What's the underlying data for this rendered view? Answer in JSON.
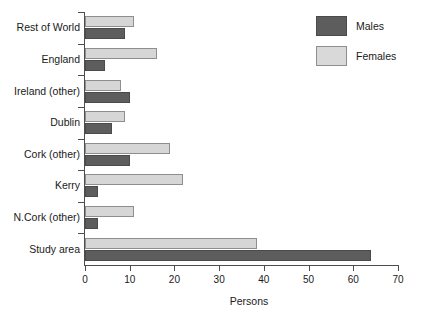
{
  "chart_data": {
    "type": "bar",
    "orientation": "horizontal",
    "title": "",
    "xlabel": "Persons",
    "ylabel": "",
    "xlim": [
      0,
      70
    ],
    "xticks": [
      0,
      10,
      20,
      30,
      40,
      50,
      60,
      70
    ],
    "grid": false,
    "legend_position": "top-right",
    "categories": [
      "Rest of World",
      "England",
      "Ireland (other)",
      "Dublin",
      "Cork (other)",
      "Kerry",
      "N.Cork (other)",
      "Study area"
    ],
    "series": [
      {
        "name": "Males",
        "color": "#5d5d5d",
        "values": [
          9,
          4.5,
          10,
          6,
          10,
          3,
          3,
          64
        ]
      },
      {
        "name": "Females",
        "color": "#d6d6d6",
        "values": [
          11,
          16,
          8,
          9,
          19,
          22,
          11,
          38.5
        ]
      }
    ]
  },
  "legend": {
    "items": [
      {
        "label": "Males",
        "swatch": "males"
      },
      {
        "label": "Females",
        "swatch": "females"
      }
    ]
  },
  "axis": {
    "x_title": "Persons",
    "x_tick_labels": [
      "0",
      "10",
      "20",
      "30",
      "40",
      "50",
      "60",
      "70"
    ]
  }
}
